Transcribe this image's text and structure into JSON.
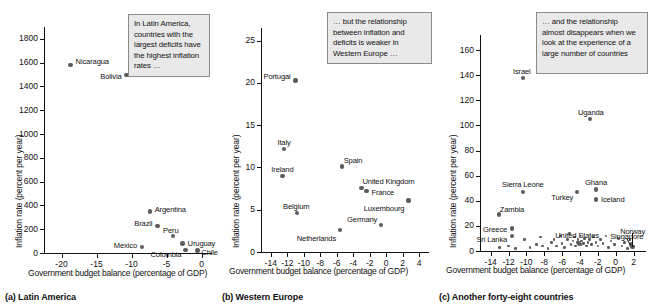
{
  "figure": {
    "axis_label_x": "Government budget balance (percentage of GDP)",
    "axis_label_y": "Inflation rate (percent per year)"
  },
  "panels": [
    {
      "id": "a",
      "caption": "(a) Latin America",
      "callout": "In Latin America, countries with the largest deficits have the highest inflation rates …",
      "chart_data": {
        "type": "scatter",
        "title": "(a) Latin America",
        "xlabel": "Government budget balance (percentage of GDP)",
        "ylabel": "Inflation rate (percent per year)",
        "xlim": [
          -22.5,
          1.5
        ],
        "ylim": [
          0,
          1900
        ],
        "xticks": [
          -20,
          -15,
          -10,
          -5,
          0
        ],
        "yticks": [
          0,
          200,
          400,
          600,
          800,
          1000,
          1200,
          1400,
          1600,
          1800
        ],
        "grid": false,
        "legend": "none",
        "points": [
          {
            "label": "Nicaragua",
            "x": -18.7,
            "y": 1583
          },
          {
            "label": "Bolivia",
            "x": -10.7,
            "y": 1495
          },
          {
            "label": "Argentina",
            "x": -7.4,
            "y": 348
          },
          {
            "label": "Brazil",
            "x": -6.3,
            "y": 225
          },
          {
            "label": "Peru",
            "x": -4.1,
            "y": 145
          },
          {
            "label": "Uruguay",
            "x": -2.7,
            "y": 80
          },
          {
            "label": "Mexico",
            "x": -8.5,
            "y": 48
          },
          {
            "label": "Colombia",
            "x": -2.3,
            "y": 27
          },
          {
            "label": "Chile",
            "x": -0.6,
            "y": 20
          }
        ]
      }
    },
    {
      "id": "b",
      "caption": "(b) Western Europe",
      "callout": "… but the relationship between inflation and deficits is weaker in Western Europe …",
      "chart_data": {
        "type": "scatter",
        "title": "(b) Western Europe",
        "xlabel": "Government budget balance (percentage of GDP)",
        "ylabel": "Inflation rate (percent per year)",
        "xlim": [
          -15.2,
          5.2
        ],
        "ylim": [
          0,
          26.5
        ],
        "xticks": [
          -14,
          -12,
          -10,
          -8,
          -6,
          -4,
          -2,
          0,
          2,
          4
        ],
        "yticks": [
          0,
          5,
          10,
          15,
          20,
          25
        ],
        "grid": false,
        "legend": "none",
        "points": [
          {
            "label": "Portugal",
            "x": -11.0,
            "y": 20.3
          },
          {
            "label": "Italy",
            "x": -12.4,
            "y": 12.2
          },
          {
            "label": "Ireland",
            "x": -12.6,
            "y": 9.0
          },
          {
            "label": "Spain",
            "x": -5.4,
            "y": 10.1
          },
          {
            "label": "United Kingdom",
            "x": -3.0,
            "y": 7.6
          },
          {
            "label": "France",
            "x": -2.4,
            "y": 7.2
          },
          {
            "label": "Luxembourg",
            "x": 2.7,
            "y": 6.1
          },
          {
            "label": "Belgium",
            "x": -10.8,
            "y": 4.6
          },
          {
            "label": "Germany",
            "x": -0.6,
            "y": 3.2
          },
          {
            "label": "Netherlands",
            "x": -5.6,
            "y": 2.6
          }
        ]
      }
    },
    {
      "id": "c",
      "caption": "(c) Another forty-eight countries",
      "callout": "… and the relationship almost disappears when we look at the experience of a large number of countries",
      "chart_data": {
        "type": "scatter",
        "title": "(c) Another forty-eight countries",
        "xlabel": "Government budget balance (percentage of GDP)",
        "ylabel": "Inflation rate (percent per year)",
        "xlim": [
          -15.2,
          3.4
        ],
        "ylim": [
          0,
          172
        ],
        "xticks": [
          -14,
          -12,
          -10,
          -8,
          -6,
          -4,
          -2,
          0,
          2
        ],
        "yticks": [
          0,
          20,
          40,
          60,
          80,
          100,
          120,
          140,
          160
        ],
        "grid": false,
        "legend": "none",
        "labeled_points": [
          {
            "label": "Israel",
            "x": -10.4,
            "y": 138
          },
          {
            "label": "Uganda",
            "x": -2.9,
            "y": 105
          },
          {
            "label": "Ghana",
            "x": -2.2,
            "y": 49
          },
          {
            "label": "Sierra Leone",
            "x": -10.4,
            "y": 47
          },
          {
            "label": "Turkey",
            "x": -4.3,
            "y": 47
          },
          {
            "label": "Iceland",
            "x": -2.2,
            "y": 41
          },
          {
            "label": "Zambia",
            "x": -13.1,
            "y": 29
          },
          {
            "label": "Greece",
            "x": -11.6,
            "y": 18
          },
          {
            "label": "Sri Lanka",
            "x": -11.6,
            "y": 12
          },
          {
            "label": "United States",
            "x": -4.1,
            "y": 6
          },
          {
            "label": "Singapore",
            "x": 1.7,
            "y": 5
          },
          {
            "label": "Norway",
            "x": 1.9,
            "y": 3
          }
        ],
        "cluster_points": [
          {
            "x": -13.0,
            "y": 3
          },
          {
            "x": -12.0,
            "y": 4
          },
          {
            "x": -11.2,
            "y": 2
          },
          {
            "x": -10.2,
            "y": 9
          },
          {
            "x": -9.6,
            "y": 3
          },
          {
            "x": -8.9,
            "y": 5
          },
          {
            "x": -8.4,
            "y": 11
          },
          {
            "x": -8.2,
            "y": 4
          },
          {
            "x": -7.6,
            "y": 2
          },
          {
            "x": -7.2,
            "y": 7
          },
          {
            "x": -6.9,
            "y": 9
          },
          {
            "x": -6.6,
            "y": 4
          },
          {
            "x": -6.2,
            "y": 12
          },
          {
            "x": -6.0,
            "y": 6
          },
          {
            "x": -5.7,
            "y": 3
          },
          {
            "x": -5.4,
            "y": 9
          },
          {
            "x": -5.2,
            "y": 14
          },
          {
            "x": -5.0,
            "y": 5
          },
          {
            "x": -4.8,
            "y": 8
          },
          {
            "x": -4.6,
            "y": 11
          },
          {
            "x": -4.5,
            "y": 4
          },
          {
            "x": -4.3,
            "y": 7
          },
          {
            "x": -4.2,
            "y": 9
          },
          {
            "x": -4.0,
            "y": 12
          },
          {
            "x": -3.9,
            "y": 5
          },
          {
            "x": -3.8,
            "y": 8
          },
          {
            "x": -3.6,
            "y": 6
          },
          {
            "x": -3.5,
            "y": 10
          },
          {
            "x": -3.3,
            "y": 4
          },
          {
            "x": -3.1,
            "y": 7
          },
          {
            "x": -2.9,
            "y": 9
          },
          {
            "x": -2.7,
            "y": 5
          },
          {
            "x": -2.5,
            "y": 11
          },
          {
            "x": -2.2,
            "y": 7
          },
          {
            "x": -2.0,
            "y": 4
          },
          {
            "x": -1.7,
            "y": 9
          },
          {
            "x": -1.4,
            "y": 6
          },
          {
            "x": -1.1,
            "y": 12
          },
          {
            "x": -0.8,
            "y": 3
          },
          {
            "x": -0.5,
            "y": 8
          },
          {
            "x": -0.1,
            "y": 5
          },
          {
            "x": 0.3,
            "y": 10
          },
          {
            "x": 0.7,
            "y": 4
          },
          {
            "x": 1.0,
            "y": 7
          },
          {
            "x": 1.3,
            "y": 2
          },
          {
            "x": 1.6,
            "y": 9
          },
          {
            "x": 1.8,
            "y": 6
          },
          {
            "x": 2.0,
            "y": 4
          }
        ]
      }
    }
  ]
}
